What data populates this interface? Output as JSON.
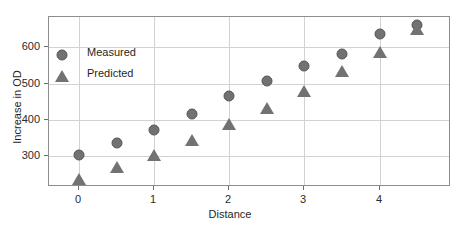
{
  "chart_data": {
    "type": "scatter",
    "title": "",
    "xlabel": "Distance",
    "ylabel": "Increase in OD",
    "x": [
      0,
      0.5,
      1,
      1.5,
      2,
      2.5,
      3,
      3.5,
      4,
      4.5
    ],
    "series": [
      {
        "name": "Measured",
        "marker": "circle",
        "color": "#727272",
        "values": [
          303,
          336,
          373,
          416,
          466,
          507,
          548,
          580,
          635,
          662
        ]
      },
      {
        "name": "Predicted",
        "marker": "triangle",
        "color": "#727272",
        "values": [
          238,
          270,
          305,
          346,
          388,
          432,
          481,
          535,
          587,
          650
        ]
      }
    ],
    "xlim": [
      -0.4,
      4.95
    ],
    "ylim": [
      216,
      683
    ],
    "xticks": [
      0,
      1,
      2,
      3,
      4
    ],
    "xticklabels": [
      "0",
      "1",
      "2",
      "3",
      "4"
    ],
    "yticks": [
      300,
      400,
      500,
      600
    ],
    "yticklabels": [
      "300",
      "400",
      "500",
      "600"
    ],
    "grid": true,
    "grid_color": "#d2d2d2",
    "legend_position": "upper left",
    "frame_color": "#8d8d8d",
    "background": "#ffffff"
  },
  "legend": {
    "items": [
      {
        "label": "Measured",
        "marker": "circle"
      },
      {
        "label": "Predicted",
        "marker": "triangle"
      }
    ]
  }
}
